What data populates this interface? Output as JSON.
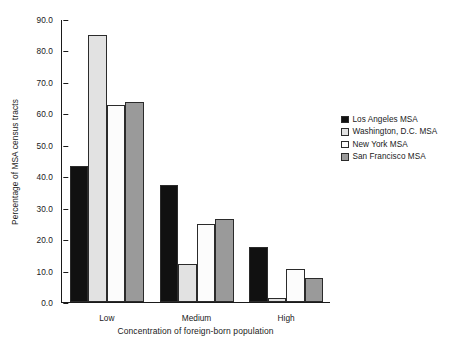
{
  "chart_data": {
    "type": "bar",
    "title": "",
    "xlabel": "Concentration of foreign-born population",
    "ylabel": "Percentage of MSA census tracts",
    "categories": [
      "Low",
      "Medium",
      "High"
    ],
    "ylim": [
      0.0,
      90.0
    ],
    "yticks": [
      "0.0",
      "10.0",
      "20.0",
      "30.0",
      "40.0",
      "50.0",
      "60.0",
      "70.0",
      "80.0",
      "90.0"
    ],
    "ytick_values": [
      0.0,
      10.0,
      20.0,
      30.0,
      40.0,
      50.0,
      60.0,
      70.0,
      80.0,
      90.0
    ],
    "grid": false,
    "legend_position": "right",
    "series": [
      {
        "name": "Los Angeles MSA",
        "color": "#111111",
        "values": [
          43.4,
          37.3,
          17.6
        ]
      },
      {
        "name": "Washington, D.C. MSA",
        "color": "#e2e2e2",
        "values": [
          85.0,
          12.0,
          1.4
        ]
      },
      {
        "name": "New York MSA",
        "color": "#fcfcfc",
        "values": [
          62.8,
          24.8,
          10.6
        ]
      },
      {
        "name": "San Francisco MSA",
        "color": "#9a9a9a",
        "values": [
          63.6,
          26.5,
          7.5
        ]
      }
    ]
  }
}
